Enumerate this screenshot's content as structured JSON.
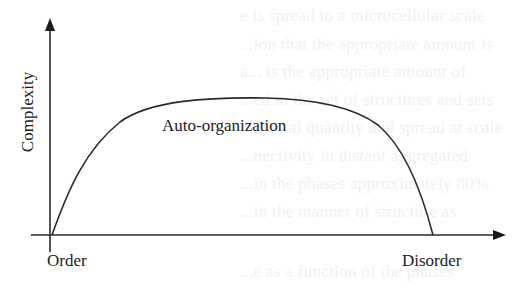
{
  "diagram": {
    "type": "conceptual-curve",
    "y_axis_label": "Complexity",
    "x_axis_start_label": "Order",
    "x_axis_end_label": "Disorder",
    "curve_label": "Auto-organization",
    "colors": {
      "line": "#2a2a2a",
      "text": "#222222",
      "background": "#ffffff",
      "bleed_text": "#f1f1f1"
    }
  },
  "background_bleed": {
    "lines": [
      "e is spread to a microcellular scale",
      "...ion that the appropriate amount is",
      "a... is the appropriate amount of",
      "...ed in the set of structures and sets",
      "...mental quantity and spread at scale",
      "...nectivity in distant aggregated",
      "...in the phases approximately 80%",
      "...in the manner of structure as",
      "...e as a function of the phases"
    ]
  }
}
